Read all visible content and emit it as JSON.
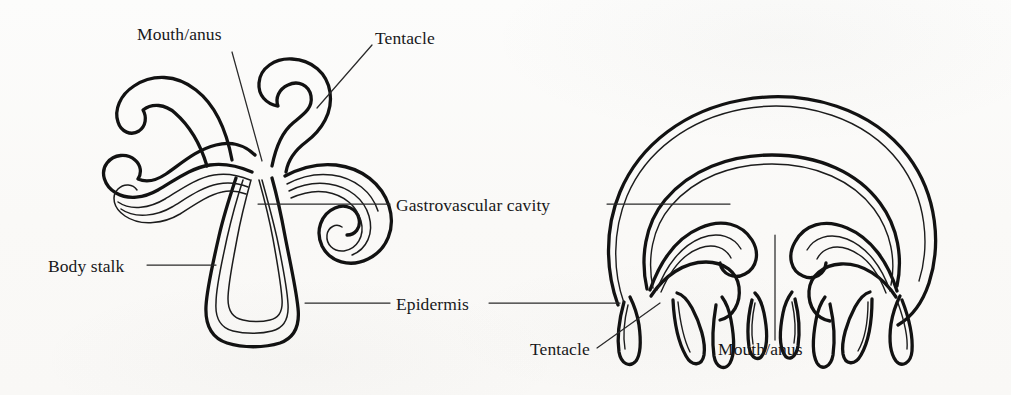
{
  "figure": {
    "background_color": "#fbfbfa",
    "ink_color": "#121212",
    "thin_ink_color": "#3a3a3a",
    "leader_color": "#2a2a2a"
  },
  "labels": {
    "mouth_anus_top": "Mouth/anus",
    "tentacle_top": "Tentacle",
    "gastrovascular_cavity": "Gastrovascular cavity",
    "body_stalk": "Body stalk",
    "epidermis": "Epidermis",
    "tentacle_bottom": "Tentacle",
    "mouth_anus_bottom": "Mouth/anus"
  },
  "diagrams": {
    "polyp": {
      "name": "polyp",
      "position": "left",
      "parts": [
        "mouth/anus",
        "tentacle",
        "gastrovascular cavity",
        "body stalk",
        "epidermis"
      ],
      "tentacle_count": 4
    },
    "medusa": {
      "name": "medusa",
      "position": "right",
      "parts": [
        "gastrovascular cavity",
        "epidermis",
        "tentacle",
        "mouth/anus"
      ],
      "tentacle_count": 8
    }
  },
  "leaders": {
    "mouth_anus_top": {
      "from_x": 232,
      "from_y": 52,
      "to_x": 262,
      "to_y": 161
    },
    "tentacle_top": {
      "from_x": 372,
      "from_y": 45,
      "to_x": 317,
      "to_y": 108
    },
    "gastrovascular_cavity_left": {
      "from_x": 258,
      "from_y": 204,
      "to_x": 390,
      "to_y": 204
    },
    "gastrovascular_cavity_right": {
      "from_x": 607,
      "from_y": 204,
      "to_x": 730,
      "to_y": 204
    },
    "body_stalk": {
      "from_x": 147,
      "from_y": 265,
      "to_x": 216,
      "to_y": 265
    },
    "epidermis_left": {
      "from_x": 305,
      "from_y": 303,
      "to_x": 390,
      "to_y": 303
    },
    "epidermis_right": {
      "from_x": 489,
      "from_y": 303,
      "to_x": 620,
      "to_y": 303
    },
    "tentacle_bottom": {
      "from_x": 597,
      "from_y": 348,
      "to_x": 660,
      "to_y": 303
    },
    "mouth_anus_bottom": {
      "from_x": 775,
      "from_y": 340,
      "to_x": 775,
      "to_y": 235
    }
  }
}
